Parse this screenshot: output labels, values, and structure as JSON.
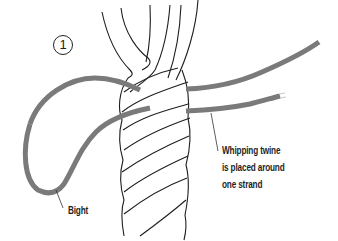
{
  "diagram": {
    "step_number": "1",
    "labels": {
      "bight": "Bight",
      "twine_line1": "Whipping twine",
      "twine_line2": "is placed around",
      "twine_line3": "one strand"
    },
    "colors": {
      "twine": "#7a7a7a",
      "rope_outline": "#1e1e1e",
      "background": "#ffffff",
      "text": "#1f1f1f"
    },
    "components": [
      "three-strand rope (vertical, laid)",
      "unlaid strand ends at top",
      "whipping twine with bight loop on left",
      "two twine ends extending to right"
    ]
  }
}
